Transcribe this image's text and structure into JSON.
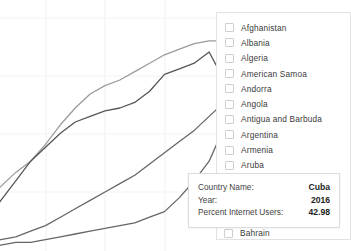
{
  "chart_data": {
    "type": "line",
    "title": "",
    "xlabel": "",
    "ylabel": "",
    "grid": true,
    "legend_position": "right",
    "xlim": [
      2000,
      2016
    ],
    "ylim": [
      0,
      80
    ],
    "x": [
      2000,
      2001,
      2002,
      2003,
      2004,
      2005,
      2006,
      2007,
      2008,
      2009,
      2010,
      2011,
      2012,
      2013,
      2014,
      2015,
      2016
    ],
    "series": [
      {
        "name": "series-upper-light",
        "color": "#9b9b9b",
        "values": [
          16,
          22,
          27,
          31,
          37,
          44,
          50,
          55,
          58,
          60,
          63,
          66,
          69,
          71,
          73,
          74,
          74
        ]
      },
      {
        "name": "series-upper-dark",
        "color": "#555555",
        "values": [
          10,
          17,
          24,
          31,
          36,
          41,
          45,
          47,
          49,
          50,
          52,
          56,
          62,
          64,
          66,
          70,
          60
        ]
      },
      {
        "name": "series-middle",
        "color": "#666666",
        "values": [
          2,
          3,
          4,
          6,
          8,
          11,
          14,
          17,
          20,
          23,
          26,
          30,
          34,
          38,
          42,
          47,
          52
        ]
      },
      {
        "name": "series-lower",
        "color": "#666666",
        "values": [
          1,
          1,
          2,
          2,
          3,
          4,
          5,
          6,
          7,
          8,
          9,
          11,
          13,
          18,
          24,
          31,
          43
        ]
      }
    ]
  },
  "legend": {
    "items": [
      {
        "label": "Afghanistan",
        "checked": false
      },
      {
        "label": "Albania",
        "checked": false
      },
      {
        "label": "Algeria",
        "checked": false
      },
      {
        "label": "American Samoa",
        "checked": false
      },
      {
        "label": "Andorra",
        "checked": false
      },
      {
        "label": "Angola",
        "checked": false
      },
      {
        "label": "Antigua and Barbuda",
        "checked": false
      },
      {
        "label": "Argentina",
        "checked": false
      },
      {
        "label": "Armenia",
        "checked": false
      },
      {
        "label": "Aruba",
        "checked": false
      }
    ],
    "bottom_item": {
      "label": "Bahrain",
      "checked": false
    }
  },
  "tooltip": {
    "rows": [
      {
        "label": "Country Name:",
        "value": "Cuba"
      },
      {
        "label": "Year:",
        "value": "2016"
      },
      {
        "label": "Percent Internet Users:",
        "value": "42.98"
      }
    ]
  },
  "colors": {
    "grid": "#f0f0f0",
    "panel_border": "#e2e2e2",
    "tooltip_border": "#dcdcdc",
    "text": "#3b3b3b",
    "value_text": "#1d1d1d"
  }
}
